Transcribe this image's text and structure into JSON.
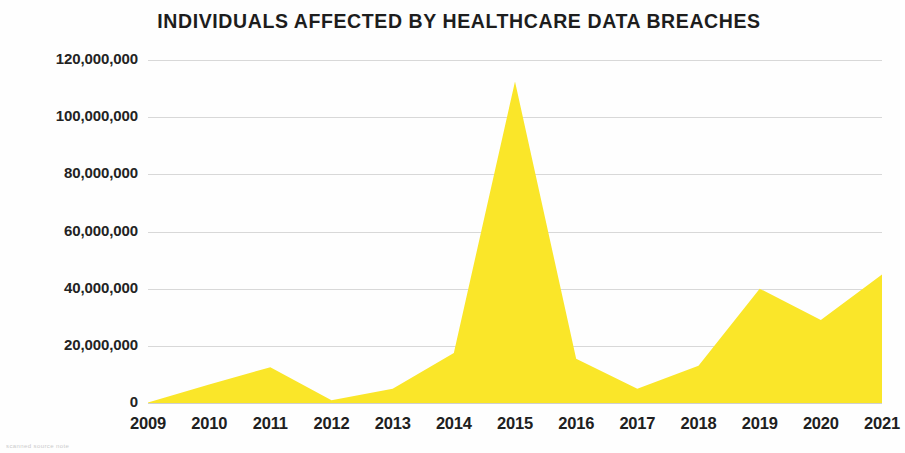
{
  "figure": {
    "title": "INDIVIDUALS AFFECTED BY HEALTHCARE DATA BREACHES",
    "footnote": "scanned source note",
    "series_color": "#FAE629",
    "gridline_color": "#d8d8d8",
    "text_color": "#202020"
  },
  "chart_data": {
    "type": "area",
    "title": "INDIVIDUALS AFFECTED BY HEALTHCARE DATA BREACHES",
    "xlabel": "",
    "ylabel": "",
    "categories": [
      "2009",
      "2010",
      "2011",
      "2012",
      "2013",
      "2014",
      "2015",
      "2016",
      "2017",
      "2018",
      "2019",
      "2020",
      "2021"
    ],
    "values": [
      200000,
      6500000,
      12500000,
      1000000,
      5000000,
      17500000,
      112500000,
      15500000,
      5000000,
      13000000,
      40000000,
      29000000,
      45000000
    ],
    "ylim": [
      0,
      120000000
    ],
    "ytick_values": [
      0,
      20000000,
      40000000,
      60000000,
      80000000,
      100000000,
      120000000
    ],
    "ytick_labels": [
      "0",
      "20,000,000",
      "40,000,000",
      "60,000,000",
      "80,000,000",
      "100,000,000",
      "120,000,000"
    ],
    "grid": true,
    "legend": "none",
    "series": [
      {
        "name": "Individuals affected",
        "color": "#FAE629",
        "values": [
          200000,
          6500000,
          12500000,
          1000000,
          5000000,
          17500000,
          112500000,
          15500000,
          5000000,
          13000000,
          40000000,
          29000000,
          45000000
        ]
      }
    ]
  }
}
